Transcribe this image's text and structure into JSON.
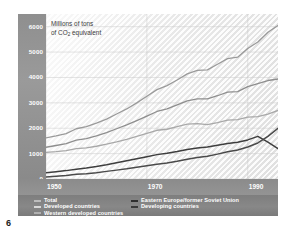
{
  "page": {
    "number": "6"
  },
  "chart_data": {
    "type": "line",
    "title": "",
    "ylabel_line1": "Millions of tons",
    "ylabel_line2_pre": "of CO",
    "ylabel_line2_sub": "2",
    "ylabel_line2_post": " equivalent",
    "xlabel": "",
    "grid": true,
    "legend_position": "bottom",
    "xlim": [
      1950,
      1996
    ],
    "ylim": [
      0,
      6500
    ],
    "yticks": [
      0,
      1000,
      2000,
      3000,
      4000,
      5000,
      6000
    ],
    "ytick_labels": [
      "0",
      "1000",
      "2000",
      "3000",
      "4000",
      "5000",
      "6000"
    ],
    "xticks": [
      1950,
      1970,
      1990
    ],
    "xtick_labels": [
      "1950",
      "1970",
      "1990"
    ],
    "x": [
      1950,
      1952,
      1954,
      1956,
      1958,
      1960,
      1962,
      1964,
      1966,
      1968,
      1970,
      1972,
      1974,
      1976,
      1978,
      1980,
      1982,
      1984,
      1986,
      1988,
      1990,
      1992,
      1994,
      1996
    ],
    "series": [
      {
        "name": "Total",
        "color": "#9a9a9a",
        "width": 1.3,
        "values": [
          1620,
          1700,
          1790,
          1980,
          2060,
          2200,
          2360,
          2560,
          2760,
          3000,
          3260,
          3520,
          3680,
          3900,
          4140,
          4280,
          4300,
          4520,
          4740,
          4800,
          5140,
          5400,
          5780,
          6050
        ]
      },
      {
        "name": "Developed countries",
        "color": "#8e8e8e",
        "width": 1.3,
        "values": [
          1250,
          1320,
          1390,
          1530,
          1590,
          1700,
          1830,
          1980,
          2130,
          2300,
          2480,
          2660,
          2760,
          2920,
          3080,
          3160,
          3160,
          3280,
          3420,
          3440,
          3640,
          3760,
          3880,
          3940
        ]
      },
      {
        "name": "Western developed countries",
        "color": "#a8a8a8",
        "width": 1.3,
        "values": [
          1050,
          1080,
          1120,
          1200,
          1230,
          1290,
          1370,
          1460,
          1560,
          1680,
          1800,
          1920,
          1960,
          2060,
          2160,
          2180,
          2140,
          2220,
          2320,
          2340,
          2440,
          2460,
          2560,
          2700
        ]
      },
      {
        "name": "Eastern Europe/former Soviet Union",
        "color": "#3e3e3e",
        "width": 1.5,
        "values": [
          250,
          290,
          330,
          380,
          430,
          490,
          560,
          640,
          720,
          800,
          880,
          960,
          1010,
          1080,
          1160,
          1220,
          1260,
          1330,
          1400,
          1450,
          1540,
          1680,
          1450,
          1200
        ]
      },
      {
        "name": "Developing countries",
        "color": "#4a4a4a",
        "width": 1.5,
        "values": [
          80,
          110,
          140,
          190,
          210,
          250,
          300,
          350,
          400,
          460,
          520,
          580,
          630,
          700,
          780,
          850,
          900,
          980,
          1070,
          1140,
          1260,
          1420,
          1680,
          2000
        ]
      }
    ]
  },
  "legend": {
    "left_column": [
      {
        "label": "Total",
        "color": "#bdbdbd"
      },
      {
        "label": "Developed countries",
        "color": "#d8d8d8"
      },
      {
        "label": "Western developed countries",
        "color": "#b0b0b0"
      }
    ],
    "right_column": [
      {
        "label": "Eastern Europe/former Soviet Union",
        "color": "#2e2e2e"
      },
      {
        "label": "Developing countries",
        "color": "#3a3a3a"
      }
    ]
  }
}
